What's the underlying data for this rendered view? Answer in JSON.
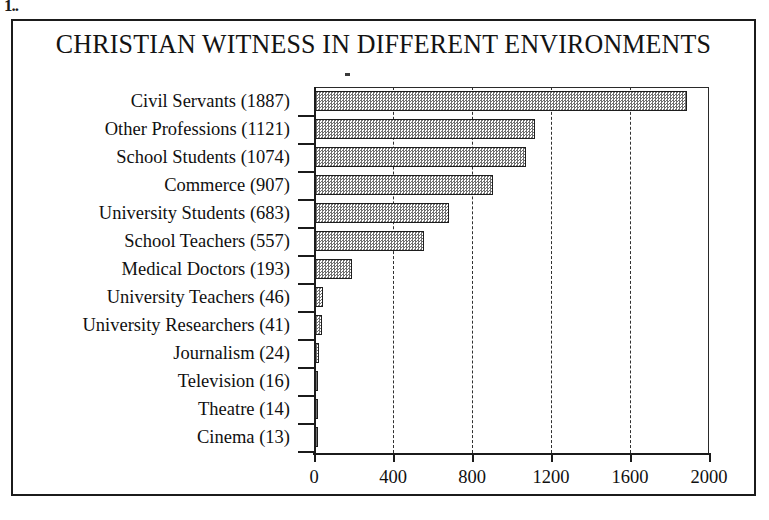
{
  "artifact": {
    "mark": "1.."
  },
  "chart_data": {
    "type": "bar",
    "orientation": "horizontal",
    "title": "CHRISTIAN WITNESS IN DIFFERENT ENVIRONMENTS",
    "xlabel": "",
    "ylabel": "",
    "xlim": [
      0,
      2000
    ],
    "xticks": [
      "0",
      "400",
      "800",
      "1200",
      "1600",
      "2000"
    ],
    "xtick_values": [
      0,
      400,
      800,
      1200,
      1600,
      2000
    ],
    "gridlines": [
      400,
      800,
      1200,
      1600
    ],
    "grid": "vertical dashed",
    "legend": "none",
    "categories": [
      "Civil Servants (1887)",
      "Other Professions (1121)",
      "School Students (1074)",
      "Commerce (907)",
      "University Students (683)",
      "School Teachers (557)",
      "Medical Doctors (193)",
      "University Teachers (46)",
      "University Researchers (41)",
      "Journalism (24)",
      "Television (16)",
      "Theatre (14)",
      "Cinema (13)"
    ],
    "values": [
      1887,
      1121,
      1074,
      907,
      683,
      557,
      193,
      46,
      41,
      24,
      16,
      14,
      13
    ],
    "series": [
      {
        "name": "Respondents",
        "values": [
          1887,
          1121,
          1074,
          907,
          683,
          557,
          193,
          46,
          41,
          24,
          16,
          14,
          13
        ]
      }
    ],
    "bar_fill": "#b0b0b0",
    "bar_outline": "#1d1d1d",
    "frame_color": "#1b1b1b"
  }
}
